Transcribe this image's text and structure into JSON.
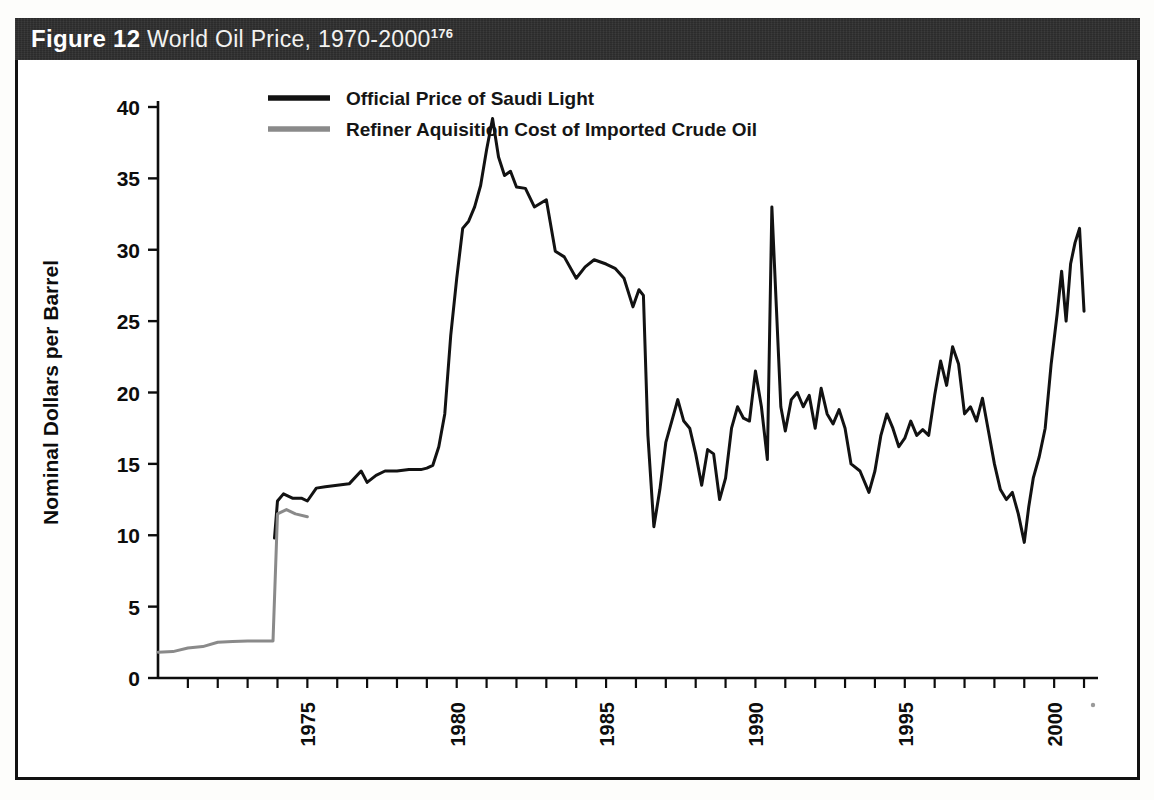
{
  "figure": {
    "number_label": "Figure 12",
    "caption": "World Oil Price, 1970-2000",
    "footnote_marker": "176"
  },
  "colors": {
    "title_bar_bg": "#2e2e2e",
    "title_text": "#f2f2f0",
    "series_saudi": "#121212",
    "series_refiner": "#8a8a8a",
    "axis": "#0d0d0d",
    "page_bg": "#ffffff"
  },
  "chart_data": {
    "type": "line",
    "title": "World Oil Price, 1970-2000",
    "xlabel": "",
    "ylabel": "Nominal Dollars per Barrel",
    "xlim": [
      1970,
      2001.2
    ],
    "ylim": [
      0,
      40
    ],
    "grid": false,
    "legend_position": "top-center",
    "y_ticks": [
      0,
      5,
      10,
      15,
      20,
      25,
      30,
      35,
      40
    ],
    "y_tick_labels": [
      "0",
      "5",
      "10",
      "15",
      "20",
      "25",
      "30",
      "35",
      "40"
    ],
    "x_ticks": [
      1971,
      1972,
      1973,
      1974,
      1975,
      1976,
      1977,
      1978,
      1979,
      1980,
      1981,
      1982,
      1983,
      1984,
      1985,
      1986,
      1987,
      1988,
      1989,
      1990,
      1991,
      1992,
      1993,
      1994,
      1995,
      1996,
      1997,
      1998,
      1999,
      2000,
      2001
    ],
    "x_tick_labels": [
      "1975",
      "1980",
      "1985",
      "1990",
      "1995",
      "2000"
    ],
    "x_labeled_ticks": [
      1975,
      1980,
      1985,
      1990,
      1995,
      2000
    ],
    "series": [
      {
        "name": "Official Price of Saudi Light",
        "color": "#121212",
        "x": [
          1973.9,
          1974.0,
          1974.2,
          1974.5,
          1974.8,
          1975.0,
          1975.3,
          1975.6,
          1976.0,
          1976.4,
          1976.8,
          1977.0,
          1977.3,
          1977.6,
          1978.0,
          1978.4,
          1978.8,
          1979.0,
          1979.2,
          1979.4,
          1979.6,
          1979.8,
          1980.0,
          1980.2,
          1980.4,
          1980.6,
          1980.8,
          1981.0,
          1981.2,
          1981.4,
          1981.6,
          1981.8,
          1982.0,
          1982.3,
          1982.6,
          1983.0,
          1983.3,
          1983.6,
          1984.0,
          1984.3,
          1984.6,
          1985.0,
          1985.3,
          1985.6,
          1985.9,
          1986.1,
          1986.25,
          1986.4,
          1986.6,
          1986.8,
          1987.0,
          1987.2,
          1987.4,
          1987.6,
          1987.8,
          1988.0,
          1988.2,
          1988.4,
          1988.6,
          1988.8,
          1989.0,
          1989.2,
          1989.4,
          1989.6,
          1989.8,
          1990.0,
          1990.2,
          1990.4,
          1990.55,
          1990.7,
          1990.85,
          1991.0,
          1991.2,
          1991.4,
          1991.6,
          1991.8,
          1992.0,
          1992.2,
          1992.4,
          1992.6,
          1992.8,
          1993.0,
          1993.2,
          1993.5,
          1993.8,
          1994.0,
          1994.2,
          1994.4,
          1994.6,
          1994.8,
          1995.0,
          1995.2,
          1995.4,
          1995.6,
          1995.8,
          1996.0,
          1996.2,
          1996.4,
          1996.6,
          1996.8,
          1997.0,
          1997.2,
          1997.4,
          1997.6,
          1997.8,
          1998.0,
          1998.2,
          1998.4,
          1998.6,
          1998.8,
          1999.0,
          1999.15,
          1999.3,
          1999.5,
          1999.7,
          1999.9,
          2000.1,
          2000.25,
          2000.4,
          2000.55,
          2000.7,
          2000.85,
          2001.0
        ],
        "y": [
          9.8,
          12.4,
          12.9,
          12.6,
          12.6,
          12.4,
          13.3,
          13.4,
          13.5,
          13.6,
          14.5,
          13.7,
          14.2,
          14.5,
          14.5,
          14.6,
          14.6,
          14.7,
          14.9,
          16.2,
          18.5,
          24.0,
          28.0,
          31.5,
          32.0,
          33.0,
          34.5,
          37.0,
          39.2,
          36.5,
          35.2,
          35.5,
          34.4,
          34.3,
          33.0,
          33.5,
          29.9,
          29.5,
          28.0,
          28.8,
          29.3,
          29.0,
          28.7,
          28.0,
          26.0,
          27.2,
          26.8,
          17.0,
          10.6,
          13.2,
          16.5,
          18.0,
          19.5,
          18.0,
          17.5,
          15.7,
          13.5,
          16.0,
          15.7,
          12.5,
          14.0,
          17.5,
          19.0,
          18.2,
          18.0,
          21.5,
          19.0,
          15.3,
          33.0,
          26.0,
          19.0,
          17.3,
          19.5,
          20.0,
          19.0,
          19.8,
          17.5,
          20.3,
          18.5,
          17.8,
          18.8,
          17.5,
          15.0,
          14.5,
          13.0,
          14.5,
          17.0,
          18.5,
          17.5,
          16.2,
          16.8,
          18.0,
          17.0,
          17.4,
          17.0,
          19.8,
          22.2,
          20.5,
          23.2,
          22.0,
          18.5,
          19.0,
          18.0,
          19.6,
          17.3,
          15.0,
          13.2,
          12.5,
          13.0,
          11.5,
          9.5,
          12.0,
          14.0,
          15.5,
          17.5,
          22.0,
          25.5,
          28.5,
          25.0,
          29.0,
          30.5,
          31.5,
          25.7
        ]
      },
      {
        "name": "Refiner Aquisition Cost of Imported Crude Oil",
        "color": "#8a8a8a",
        "x": [
          1970.0,
          1970.5,
          1971.0,
          1971.5,
          1972.0,
          1972.5,
          1973.0,
          1973.5,
          1973.85,
          1974.0,
          1974.3,
          1974.6,
          1975.0
        ],
        "y": [
          1.8,
          1.85,
          2.1,
          2.2,
          2.5,
          2.55,
          2.6,
          2.6,
          2.6,
          11.5,
          11.8,
          11.5,
          11.3
        ]
      }
    ],
    "legend": [
      {
        "label": "Official Price of Saudi Light",
        "color": "#121212"
      },
      {
        "label": "Refiner Aquisition Cost of Imported Crude Oil",
        "color": "#8a8a8a"
      }
    ]
  }
}
